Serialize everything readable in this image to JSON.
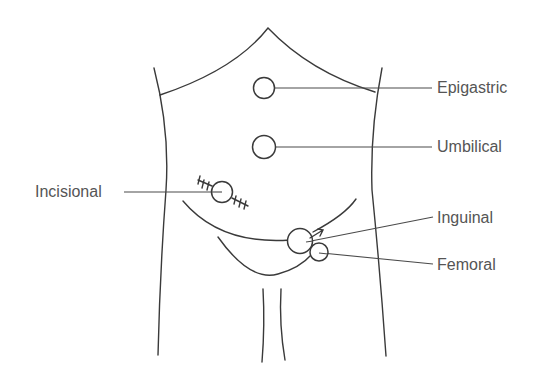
{
  "diagram": {
    "title": "",
    "labels": {
      "epigastric": "Epigastric",
      "umbilical": "Umbilical",
      "incisional": "Incisional",
      "inguinal": "Inguinal",
      "femoral": "Femoral"
    },
    "colors": {
      "line": "#3a3a3a",
      "text": "#555555",
      "background": "#ffffff"
    }
  }
}
